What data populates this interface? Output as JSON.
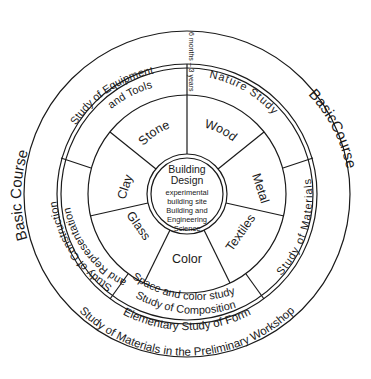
{
  "diagram": {
    "type": "concentric-wheel",
    "outer_ring": {
      "left_label": "Basic Course",
      "right_label": "BasicCourse",
      "bottom_line1": "Elementary Study of Form",
      "bottom_line2": "Study of Materials in the Preliminary Workshop",
      "duration": "6 months – 3 years"
    },
    "middle_ring": [
      {
        "label": "Study of Equipment",
        "label2": "and Tools"
      },
      {
        "label": "Nature Study"
      },
      {
        "label": "Study of Materials"
      },
      {
        "label": "Space and color study",
        "label2": "Study of Composition"
      },
      {
        "label": "Study of Construction",
        "label2": "and Representation"
      }
    ],
    "inner_ring": [
      {
        "label": "Stone"
      },
      {
        "label": "Wood"
      },
      {
        "label": "Metal"
      },
      {
        "label": "Textiles"
      },
      {
        "label": "Color"
      },
      {
        "label": "Glass"
      },
      {
        "label": "Clay"
      }
    ],
    "center": {
      "title1": "Building",
      "title2": "Design",
      "line1": "experimental",
      "line2": "building site",
      "line3": "Building and",
      "line4": "Engineering",
      "line5": "Science"
    }
  }
}
